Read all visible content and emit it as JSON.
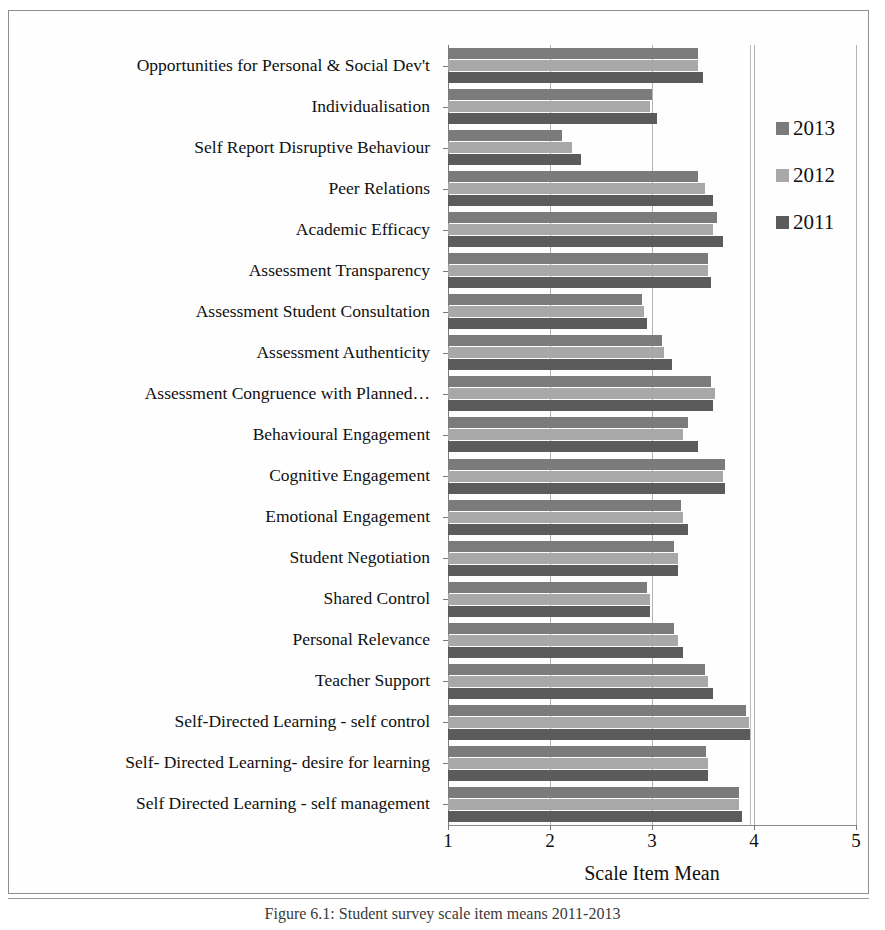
{
  "figure": {
    "caption": "Figure 6.1: Student survey scale item means 2011-2013"
  },
  "chart_data": {
    "type": "bar",
    "orientation": "horizontal",
    "title": "",
    "xlabel": "Scale Item Mean",
    "ylabel": "",
    "xlim": [
      1,
      5
    ],
    "xticks": [
      1,
      2,
      3,
      4,
      5
    ],
    "grid": "vertical",
    "legend_position": "right",
    "categories": [
      "Opportunities for Personal & Social Dev't",
      "Individualisation",
      "Self Report Disruptive Behaviour",
      "Peer Relations",
      "Academic Efficacy",
      "Assessment Transparency",
      "Assessment Student Consultation",
      "Assessment Authenticity",
      "Assessment Congruence with Planned…",
      "Behavioural Engagement",
      "Cognitive Engagement",
      "Emotional Engagement",
      "Student Negotiation",
      "Shared Control",
      "Personal Relevance",
      "Teacher Support",
      "Self-Directed Learning - self control",
      "Self- Directed Learning- desire for learning",
      "Self Directed Learning - self management"
    ],
    "series": [
      {
        "name": "2013",
        "color": "#7b7b7b",
        "values": [
          3.45,
          3.0,
          2.12,
          3.45,
          3.64,
          3.55,
          2.9,
          3.1,
          3.58,
          3.35,
          3.72,
          3.28,
          3.22,
          2.95,
          3.22,
          3.52,
          3.92,
          3.53,
          3.85
        ]
      },
      {
        "name": "2012",
        "color": "#a8a8a8",
        "values": [
          3.45,
          2.98,
          2.22,
          3.52,
          3.6,
          3.55,
          2.92,
          3.12,
          3.62,
          3.3,
          3.7,
          3.3,
          3.25,
          2.98,
          3.25,
          3.55,
          3.95,
          3.55,
          3.85
        ]
      },
      {
        "name": "2011",
        "color": "#5b5b5b",
        "values": [
          3.5,
          3.05,
          2.3,
          3.6,
          3.7,
          3.58,
          2.95,
          3.2,
          3.6,
          3.45,
          3.72,
          3.35,
          3.25,
          2.98,
          3.3,
          3.6,
          3.97,
          3.55,
          3.88
        ]
      }
    ]
  },
  "legend": {
    "items": [
      {
        "label": "2013",
        "color": "#7b7b7b"
      },
      {
        "label": "2012",
        "color": "#a8a8a8"
      },
      {
        "label": "2011",
        "color": "#5b5b5b"
      }
    ]
  }
}
